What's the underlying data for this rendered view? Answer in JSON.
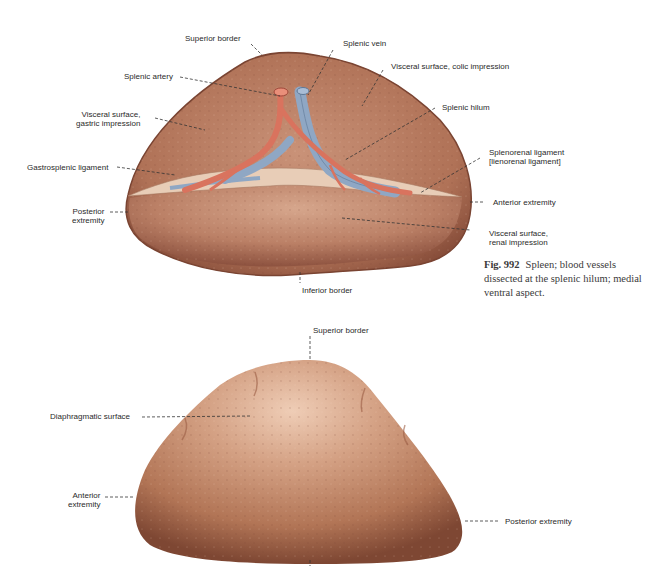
{
  "figure": {
    "number": "Fig. 992",
    "caption": "Spleen; blood vessels dissected at the splenic hilum; medial ventral aspect."
  },
  "top_view": {
    "labels": {
      "superior_border": "Superior border",
      "splenic_vein": "Splenic vein",
      "splenic_artery": "Splenic artery",
      "visceral_colic": "Visceral surface, colic impression",
      "visceral_gastric": "Visceral surface,\ngastric impression",
      "splenic_hilum": "Splenic hilum",
      "gastrosplenic_ligament": "Gastrosplenic ligament",
      "splenorenal_ligament": "Splenorenal ligament\n[lienorenal ligament]",
      "posterior_extremity": "Posterior\nextremity",
      "anterior_extremity": "Anterior extremity",
      "visceral_renal": "Visceral surface,\nrenal impression",
      "inferior_border": "Inferior border"
    }
  },
  "bottom_view": {
    "labels": {
      "superior_border": "Superior border",
      "diaphragmatic_surface": "Diaphragmatic surface",
      "anterior_extremity": "Anterior\nextremity",
      "posterior_extremity": "Posterior extremity"
    }
  },
  "colors": {
    "spleen_base": "#b77a5c",
    "spleen_dark": "#8a4f3a",
    "spleen_light": "#e0b49a",
    "artery": "#d9735e",
    "vein": "#8fa7c4",
    "leader": "#333333"
  }
}
